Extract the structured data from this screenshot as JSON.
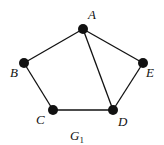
{
  "graph": {
    "name": "G",
    "subscript": "1",
    "nodes": [
      {
        "id": "A",
        "label": "A",
        "x": 83,
        "y": 29,
        "lx": 88,
        "ly": 19
      },
      {
        "id": "B",
        "label": "B",
        "x": 24,
        "y": 63,
        "lx": 10,
        "ly": 77
      },
      {
        "id": "C",
        "label": "C",
        "x": 53,
        "y": 110,
        "lx": 36,
        "ly": 124
      },
      {
        "id": "D",
        "label": "D",
        "x": 113,
        "y": 110,
        "lx": 118,
        "ly": 126
      },
      {
        "id": "E",
        "label": "E",
        "x": 143,
        "y": 63,
        "lx": 146,
        "ly": 77
      }
    ],
    "edges": [
      [
        "A",
        "B"
      ],
      [
        "B",
        "C"
      ],
      [
        "C",
        "D"
      ],
      [
        "A",
        "D"
      ],
      [
        "A",
        "E"
      ],
      [
        "E",
        "D"
      ]
    ]
  }
}
